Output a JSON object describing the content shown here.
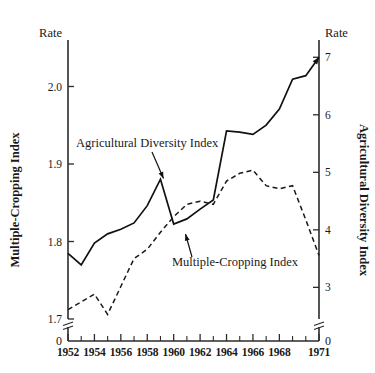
{
  "chart_data": {
    "type": "line",
    "title": "",
    "subtitle": "",
    "xlabel": "",
    "x": [
      1952,
      1953,
      1954,
      1955,
      1956,
      1957,
      1958,
      1959,
      1960,
      1961,
      1962,
      1963,
      1964,
      1965,
      1966,
      1967,
      1968,
      1969,
      1970,
      1971
    ],
    "xtick_labels": [
      "1952",
      "1954",
      "1956",
      "1958",
      "1960",
      "1962",
      "1964",
      "1966",
      "1968",
      "1971"
    ],
    "xtick_values": [
      1952,
      1954,
      1956,
      1958,
      1960,
      1962,
      1964,
      1966,
      1968,
      1971
    ],
    "xlim": [
      1952,
      1971
    ],
    "grid": false,
    "legend": "inline-annotations",
    "left_axis": {
      "corner_label": "Rate",
      "title": "Multiple-Cropping Index",
      "tick_labels": [
        "2.0",
        "1.9",
        "1.8",
        "1.7"
      ],
      "tick_values": [
        2.0,
        1.9,
        1.8,
        1.7
      ],
      "zero_label": "0",
      "axis_break": true,
      "ylim": [
        1.7,
        2.06
      ]
    },
    "right_axis": {
      "corner_label": "Rate",
      "title": "Agricultural Diversity Index",
      "tick_labels": [
        "7",
        "6",
        "5",
        "4",
        "3"
      ],
      "tick_values": [
        7,
        6,
        5,
        4,
        3
      ],
      "zero_label": "0",
      "axis_break": true,
      "ylim": [
        2.45,
        7.3
      ]
    },
    "series": [
      {
        "name": "Agricultural Diversity Index",
        "style": "solid",
        "axis": "right",
        "color": "#111111",
        "arrow_end": true,
        "values": [
          3.59,
          3.39,
          3.77,
          3.93,
          4.01,
          4.12,
          4.42,
          4.88,
          4.1,
          4.19,
          4.36,
          4.52,
          5.72,
          5.7,
          5.66,
          5.82,
          6.1,
          6.62,
          6.68,
          7.0
        ]
      },
      {
        "name": "Multiple-Cropping Index",
        "style": "dashed",
        "axis": "left",
        "color": "#1a1a1a",
        "arrow_end": false,
        "values": [
          1.712,
          1.722,
          1.732,
          1.706,
          1.742,
          1.778,
          1.79,
          1.812,
          1.832,
          1.848,
          1.852,
          1.848,
          1.878,
          1.888,
          1.892,
          1.872,
          1.868,
          1.872,
          1.828,
          1.782
        ]
      }
    ],
    "annotations": [
      {
        "text": "Agricultural Diversity Index",
        "target_year": 1959,
        "target_series": "Agricultural Diversity Index"
      },
      {
        "text": "Multiple-Cropping Index",
        "target_year": 1963,
        "target_series": "Multiple-Cropping Index"
      }
    ]
  }
}
